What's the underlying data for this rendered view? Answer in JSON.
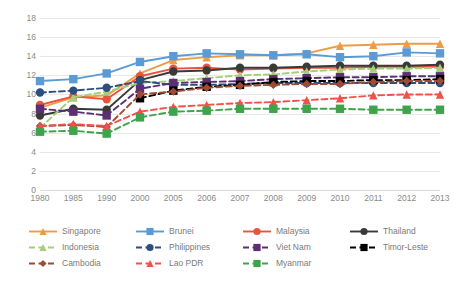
{
  "chart_data": {
    "type": "line",
    "title": "",
    "xlabel": "",
    "ylabel": "",
    "ylim": [
      0,
      18
    ],
    "ytick_step": 2,
    "grid": true,
    "legend_position": "bottom",
    "categories": [
      "1980",
      "1985",
      "1990",
      "2000",
      "2005",
      "2006",
      "2007",
      "2008",
      "2009",
      "2010",
      "2011",
      "2012",
      "2013"
    ],
    "yticks": [
      "0",
      "2",
      "4",
      "6",
      "8",
      "10",
      "12",
      "14",
      "16",
      "18"
    ],
    "series": [
      {
        "name": "Singapore",
        "color": "#ED9C45",
        "dash": "solid",
        "marker": "triangle",
        "values": [
          8.6,
          9.7,
          9.9,
          12.2,
          13.6,
          13.9,
          14.1,
          14.1,
          14.3,
          15.1,
          15.2,
          15.3,
          15.3
        ]
      },
      {
        "name": "Brunei",
        "color": "#5B9BD5",
        "dash": "solid",
        "marker": "square",
        "values": [
          11.4,
          11.6,
          12.2,
          13.4,
          14.0,
          14.3,
          14.2,
          14.1,
          14.2,
          13.9,
          14.0,
          14.4,
          14.3
        ]
      },
      {
        "name": "Malaysia",
        "color": "#E8553C",
        "dash": "solid",
        "marker": "circle",
        "values": [
          8.9,
          9.8,
          9.5,
          11.9,
          12.7,
          12.8,
          12.6,
          12.7,
          12.8,
          12.8,
          12.9,
          12.9,
          12.9
        ]
      },
      {
        "name": "Thailand",
        "color": "#3A3A38",
        "dash": "solid",
        "marker": "circle",
        "values": [
          7.8,
          8.5,
          8.4,
          11.5,
          12.4,
          12.5,
          12.8,
          12.8,
          12.9,
          13.0,
          13.0,
          13.0,
          13.1
        ]
      },
      {
        "name": "Indonesia",
        "color": "#A5CE7B",
        "dash": "dashed",
        "marker": "triangle",
        "values": [
          6.5,
          9.7,
          10.3,
          11.2,
          11.4,
          11.7,
          12.0,
          12.1,
          12.4,
          12.6,
          12.7,
          12.7,
          12.8
        ]
      },
      {
        "name": "Philippines",
        "color": "#2E4E7E",
        "dash": "dashed",
        "marker": "circle",
        "values": [
          10.2,
          10.4,
          10.7,
          11.4,
          11.0,
          11.0,
          11.1,
          11.2,
          11.2,
          11.2,
          11.2,
          11.2,
          11.2
        ]
      },
      {
        "name": "Viet Nam",
        "color": "#5C2E73",
        "dash": "dashed",
        "marker": "square",
        "values": [
          8.5,
          8.2,
          7.8,
          10.6,
          11.2,
          11.3,
          11.4,
          11.6,
          11.7,
          11.8,
          11.8,
          11.9,
          11.9
        ]
      },
      {
        "name": "Timor-Leste",
        "color": "#000000",
        "dash": "dashed",
        "marker": "square",
        "values": [
          null,
          null,
          null,
          9.6,
          10.4,
          10.8,
          11.0,
          11.3,
          11.4,
          11.4,
          11.5,
          11.5,
          11.6
        ]
      },
      {
        "name": "Cambodia",
        "color": "#9E4A35",
        "dash": "dashed",
        "marker": "diamond",
        "values": [
          6.7,
          6.8,
          6.6,
          10.0,
          10.3,
          10.7,
          10.9,
          11.0,
          11.1,
          11.1,
          11.3,
          11.4,
          11.4
        ]
      },
      {
        "name": "Lao PDR",
        "color": "#F0514A",
        "dash": "dashed",
        "marker": "triangle",
        "values": [
          6.7,
          6.9,
          6.7,
          8.2,
          8.7,
          8.9,
          9.1,
          9.2,
          9.4,
          9.6,
          9.9,
          10.0,
          10.0
        ]
      },
      {
        "name": "Myanmar",
        "color": "#3FA34D",
        "dash": "dashed",
        "marker": "square",
        "values": [
          6.1,
          6.2,
          5.9,
          7.6,
          8.2,
          8.3,
          8.5,
          8.5,
          8.5,
          8.5,
          8.4,
          8.4,
          8.4
        ]
      }
    ]
  },
  "legend": {
    "items": [
      {
        "label": "Singapore"
      },
      {
        "label": "Brunei"
      },
      {
        "label": "Malaysia"
      },
      {
        "label": "Thailand"
      },
      {
        "label": "Indonesia"
      },
      {
        "label": "Philippines"
      },
      {
        "label": "Viet Nam"
      },
      {
        "label": "Timor-Leste"
      },
      {
        "label": "Cambodia"
      },
      {
        "label": "Lao PDR"
      },
      {
        "label": "Myanmar"
      }
    ]
  }
}
